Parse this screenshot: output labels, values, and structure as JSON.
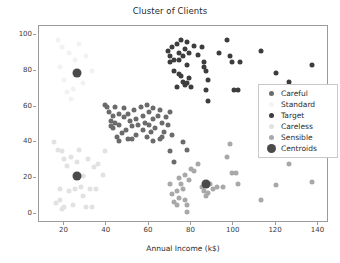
{
  "chart_data": {
    "type": "scatter",
    "title": "Cluster of Clients",
    "xlabel": "Annual Income (k$)",
    "ylabel": "Spending Score (1-100)",
    "xlim": [
      8,
      145
    ],
    "ylim": [
      -5,
      105
    ],
    "xticks": [
      20,
      40,
      60,
      80,
      100,
      120,
      140
    ],
    "yticks": [
      0,
      20,
      40,
      60,
      80,
      100
    ],
    "grid": false,
    "legend_position": "center-right",
    "series": [
      {
        "name": "Careful",
        "color": "#6b6b6b",
        "marker_size": 5,
        "points": [
          [
            39,
            61
          ],
          [
            40,
            60
          ],
          [
            41,
            57
          ],
          [
            42,
            52
          ],
          [
            42,
            49
          ],
          [
            43,
            55
          ],
          [
            43,
            48
          ],
          [
            44,
            60
          ],
          [
            44,
            51
          ],
          [
            45,
            43
          ],
          [
            46,
            56
          ],
          [
            46,
            50
          ],
          [
            47,
            45
          ],
          [
            48,
            59
          ],
          [
            48,
            54
          ],
          [
            49,
            47
          ],
          [
            50,
            42
          ],
          [
            50,
            56
          ],
          [
            51,
            52
          ],
          [
            52,
            49
          ],
          [
            53,
            58
          ],
          [
            54,
            44
          ],
          [
            54,
            53
          ],
          [
            55,
            50
          ],
          [
            56,
            60
          ],
          [
            57,
            55
          ],
          [
            57,
            47
          ],
          [
            58,
            51
          ],
          [
            59,
            43
          ],
          [
            60,
            57
          ],
          [
            60,
            50
          ],
          [
            61,
            46
          ],
          [
            62,
            59
          ],
          [
            62,
            53
          ],
          [
            63,
            48
          ],
          [
            64,
            55
          ],
          [
            65,
            42
          ],
          [
            65,
            58
          ],
          [
            66,
            51
          ],
          [
            67,
            46
          ],
          [
            68,
            54
          ],
          [
            69,
            50
          ],
          [
            70,
            57
          ],
          [
            71,
            44
          ],
          [
            62,
            41
          ],
          [
            59,
            61
          ],
          [
            46,
            41
          ],
          [
            52,
            42
          ],
          [
            66,
            43
          ],
          [
            70,
            35
          ],
          [
            72,
            29
          ],
          [
            76,
            40
          ],
          [
            78,
            36
          ]
        ]
      },
      {
        "name": "Standard",
        "color": "#f2f2f2",
        "marker_size": 5,
        "points": [
          [
            17,
            97
          ],
          [
            19,
            93
          ],
          [
            22,
            90
          ],
          [
            25,
            86
          ],
          [
            27,
            95
          ],
          [
            20,
            75
          ],
          [
            24,
            70
          ],
          [
            30,
            88
          ],
          [
            18,
            82
          ],
          [
            29,
            73
          ],
          [
            33,
            80
          ],
          [
            23,
            64
          ],
          [
            21,
            68
          ]
        ]
      },
      {
        "name": "Target",
        "color": "#3d3d3d",
        "marker_size": 5,
        "points": [
          [
            69,
            91
          ],
          [
            70,
            88
          ],
          [
            71,
            93
          ],
          [
            72,
            86
          ],
          [
            73,
            95
          ],
          [
            74,
            90
          ],
          [
            75,
            97
          ],
          [
            76,
            88
          ],
          [
            77,
            92
          ],
          [
            78,
            83
          ],
          [
            79,
            90
          ],
          [
            75,
            77
          ],
          [
            76,
            74
          ],
          [
            77,
            72
          ],
          [
            78,
            73
          ],
          [
            79,
            76
          ],
          [
            74,
            78
          ],
          [
            73,
            71
          ],
          [
            80,
            71
          ],
          [
            81,
            94
          ],
          [
            83,
            89
          ],
          [
            85,
            93
          ],
          [
            86,
            82
          ],
          [
            87,
            80
          ],
          [
            86,
            85
          ],
          [
            88,
            75
          ],
          [
            87,
            69
          ],
          [
            88,
            63
          ],
          [
            93,
            90
          ],
          [
            97,
            97
          ],
          [
            98,
            88
          ],
          [
            99,
            85
          ],
          [
            100,
            69
          ],
          [
            102,
            69
          ],
          [
            103,
            85
          ],
          [
            113,
            91
          ],
          [
            120,
            79
          ],
          [
            126,
            74
          ],
          [
            137,
            83
          ],
          [
            70,
            85
          ],
          [
            72,
            80
          ],
          [
            74,
            86
          ],
          [
            78,
            96
          ]
        ]
      },
      {
        "name": "Careless",
        "color": "#e2e2e2",
        "marker_size": 5,
        "points": [
          [
            15,
            40
          ],
          [
            16,
            6
          ],
          [
            17,
            36
          ],
          [
            18,
            14
          ],
          [
            19,
            3
          ],
          [
            19,
            35
          ],
          [
            20,
            31
          ],
          [
            21,
            27
          ],
          [
            22,
            13
          ],
          [
            23,
            32
          ],
          [
            24,
            5
          ],
          [
            25,
            14
          ],
          [
            26,
            29
          ],
          [
            27,
            36
          ],
          [
            28,
            15
          ],
          [
            29,
            21
          ],
          [
            30,
            4
          ],
          [
            31,
            31
          ],
          [
            32,
            14
          ],
          [
            33,
            4
          ],
          [
            34,
            26
          ],
          [
            36,
            28
          ],
          [
            38,
            22
          ],
          [
            39,
            35
          ],
          [
            20,
            4
          ],
          [
            18,
            8
          ],
          [
            29,
            10
          ],
          [
            35,
            14
          ]
        ]
      },
      {
        "name": "Sensible",
        "color": "#a8a8a8",
        "marker_size": 5,
        "points": [
          [
            71,
            11
          ],
          [
            72,
            7
          ],
          [
            73,
            5
          ],
          [
            73,
            13
          ],
          [
            74,
            9
          ],
          [
            75,
            17
          ],
          [
            76,
            14
          ],
          [
            77,
            8
          ],
          [
            77,
            22
          ],
          [
            78,
            5
          ],
          [
            78,
            1
          ],
          [
            79,
            19
          ],
          [
            80,
            25
          ],
          [
            81,
            24
          ],
          [
            83,
            28
          ],
          [
            85,
            15
          ],
          [
            86,
            13
          ],
          [
            87,
            10
          ],
          [
            88,
            12
          ],
          [
            89,
            17
          ],
          [
            90,
            14
          ],
          [
            92,
            15
          ],
          [
            95,
            15
          ],
          [
            97,
            32
          ],
          [
            98,
            39
          ],
          [
            99,
            23
          ],
          [
            101,
            23
          ],
          [
            102,
            17
          ],
          [
            113,
            8
          ],
          [
            120,
            16
          ],
          [
            126,
            28
          ],
          [
            137,
            18
          ],
          [
            70,
            17
          ],
          [
            74,
            20
          ]
        ]
      },
      {
        "name": "Centroids",
        "color": "#4a4a4a",
        "marker_size": 9,
        "points": [
          [
            26,
            79
          ],
          [
            26,
            21
          ],
          [
            87,
            17
          ]
        ]
      }
    ]
  },
  "legend": {
    "items": [
      {
        "label": "Careful",
        "color": "#6b6b6b",
        "size": 5
      },
      {
        "label": "Standard",
        "color": "#f4f4f4",
        "size": 5
      },
      {
        "label": "Target",
        "color": "#3d3d3d",
        "size": 5
      },
      {
        "label": "Careless",
        "color": "#e2e2e2",
        "size": 5
      },
      {
        "label": "Sensible",
        "color": "#a8a8a8",
        "size": 5
      },
      {
        "label": "Centroids",
        "color": "#4a4a4a",
        "size": 9
      }
    ]
  }
}
